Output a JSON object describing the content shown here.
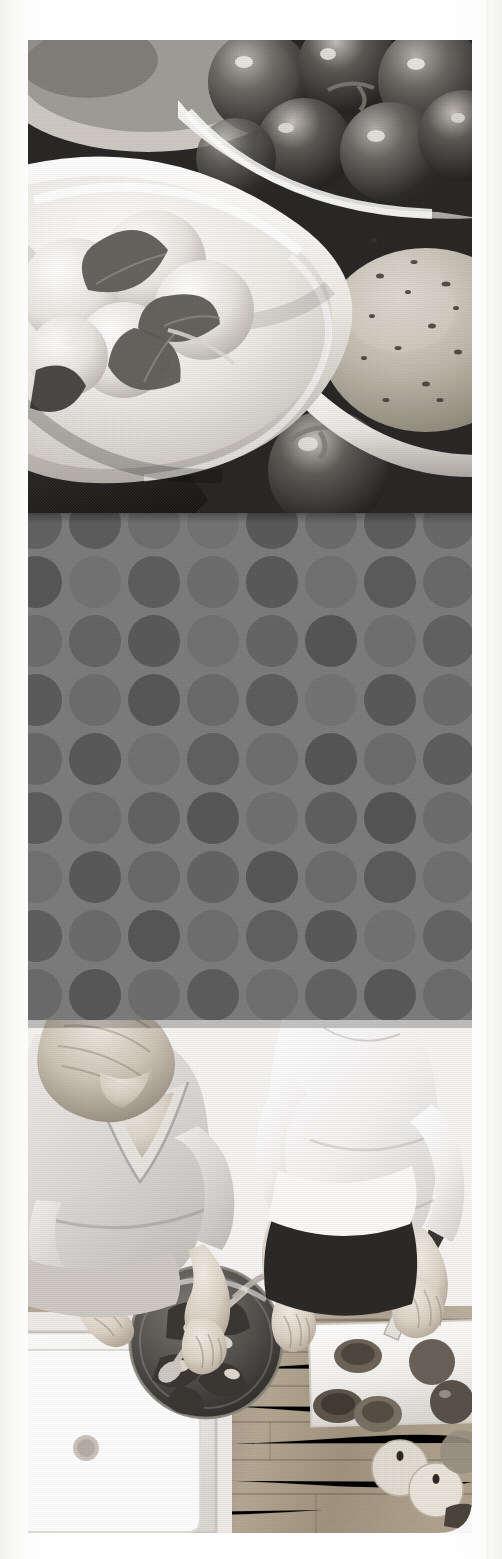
{
  "page": {
    "kind": "scanned-brochure-page-strip",
    "orientation": "portrait",
    "color_mode": "grayscale",
    "width_px": 502,
    "height_px": 1559,
    "paper_color": "#ffffff",
    "content_left_px": 28,
    "content_right_px": 472,
    "content_top_px": 40,
    "content_bottom_px": 1533
  },
  "bands": [
    {
      "id": "top-photo",
      "name": "food-still-life-photo",
      "subject": "Bowl of mozzarella balls with basil leaves, bowl of cherry tomatoes on the vine, seeded bread roll",
      "top_px": 40,
      "height_px": 473,
      "tone": "grayscale",
      "palette": {
        "dark": "#2b2b2b",
        "mid": "#6f6f6f",
        "light": "#d8d6d2",
        "highlight": "#f4f2ee"
      }
    },
    {
      "id": "dot-panel",
      "name": "polka-dot-pattern-panel",
      "subject": "Flat graphic panel of repeating circles in two grey tones",
      "top_px": 513,
      "height_px": 507,
      "background_color": "#7d7d7d",
      "dot_colors": [
        "#5c5c5c",
        "#6d6d6d",
        "#757575"
      ],
      "dot_pitch_px": 59,
      "dot_diameter_px": 52,
      "columns": 8,
      "rows": 9
    },
    {
      "id": "bottom-photo",
      "name": "kitchen-overhead-photo",
      "subject": "Overhead view of two people preparing a salad at a wooden kitchen counter with a sink, glass salad bowl, cutting board, knife, tomatoes and apples",
      "top_px": 1020,
      "height_px": 513,
      "tone": "grayscale",
      "palette": {
        "dark": "#1f1f1f",
        "mid": "#8d8a85",
        "light": "#e6e3de",
        "highlight": "#fbfaf8"
      },
      "elements": [
        "blonde-woman-grey-top",
        "person-white-shirt-dark-trousers",
        "stainless-sink",
        "wooden-worktop",
        "glass-salad-bowl",
        "white-cutting-board",
        "kitchen-knife",
        "sliced-tomatoes",
        "apples"
      ]
    }
  ],
  "margins": {
    "left_white_px": 28,
    "right_white_px": 30,
    "top_white_px": 40,
    "bottom_white_px": 26
  }
}
